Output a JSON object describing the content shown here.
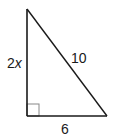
{
  "diagram": {
    "type": "right-triangle",
    "vertices": {
      "top": [
        27,
        9
      ],
      "right_angle": [
        27,
        116
      ],
      "bottom_right": [
        107,
        116
      ]
    },
    "right_angle_marker": {
      "x": 27,
      "y": 104,
      "size": 12
    },
    "colors": {
      "stroke": "#1a1a1a",
      "marker_stroke": "#888888",
      "background": "#ffffff"
    },
    "labels": {
      "vertical_leg": {
        "coefficient": "2",
        "variable": "x"
      },
      "hypotenuse": "10",
      "horizontal_leg": "6"
    }
  }
}
